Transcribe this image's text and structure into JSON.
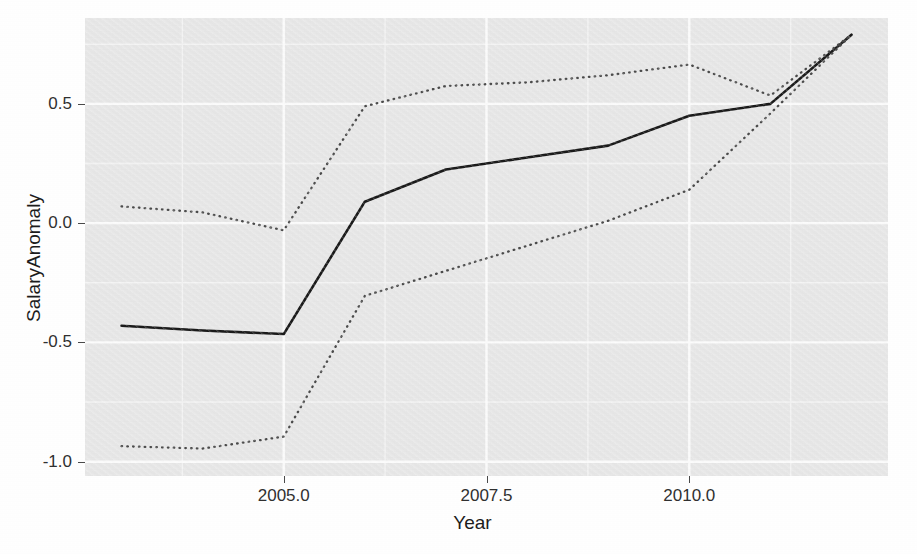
{
  "chart_data": {
    "type": "line",
    "title": "",
    "subtitle": "",
    "xlabel": "Year",
    "ylabel": "SalaryAnomaly",
    "xlim": [
      2002.55,
      2012.45
    ],
    "ylim": [
      -1.06,
      0.86
    ],
    "xticks": [
      2005.0,
      2007.5,
      2010.0
    ],
    "xtick_labels": [
      "2005.0",
      "2007.5",
      "2010.0"
    ],
    "yticks": [
      0.5,
      0.0,
      -0.5,
      -1.0
    ],
    "ytick_labels": [
      "0.5",
      "0.0",
      "-0.5",
      "-1.0"
    ],
    "grid": true,
    "grid_major_color": "#ffffff",
    "grid_minor_color": "#f7f7f7",
    "panel_color": "#ebebeb",
    "legend": "none",
    "x": [
      2003,
      2004,
      2005,
      2006,
      2007,
      2008,
      2009,
      2010,
      2011,
      2012
    ],
    "series": [
      {
        "name": "fit",
        "style": "solid",
        "color": "#1a1a1a",
        "values": [
          -0.43,
          -0.45,
          -0.465,
          0.09,
          0.225,
          0.275,
          0.325,
          0.45,
          0.5,
          0.79
        ]
      },
      {
        "name": "upper",
        "style": "dotted",
        "color": "#4d4d4d",
        "values": [
          0.07,
          0.045,
          -0.03,
          0.49,
          0.575,
          0.59,
          0.62,
          0.665,
          0.535,
          0.79
        ]
      },
      {
        "name": "lower",
        "style": "dotted",
        "color": "#4d4d4d",
        "values": [
          -0.935,
          -0.945,
          -0.895,
          -0.305,
          -0.2,
          -0.095,
          0.01,
          0.14,
          0.46,
          0.79
        ]
      }
    ]
  },
  "axes": {
    "x_title": "Year",
    "y_title": "SalaryAnomaly"
  }
}
